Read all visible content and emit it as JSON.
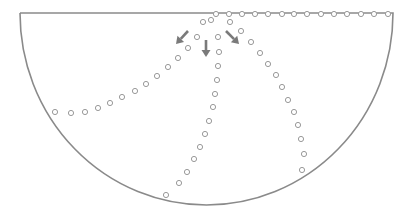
{
  "diagram": {
    "title": "",
    "shape": "half-bowl (semi-ellipse) with flat top edge",
    "bowl": {
      "left_x": 20,
      "right_x": 393,
      "top_y": 13,
      "bottom_y": 205,
      "stroke": "#8a8a8a"
    },
    "dot_style": {
      "radius": 2.6,
      "stroke": "#9a9a9a",
      "fill": "#ffffff"
    },
    "arrow_color": "#7a7a7a",
    "arrows": [
      {
        "name": "arrow-down-left",
        "x1": 188,
        "y1": 31,
        "x2": 176,
        "y2": 44
      },
      {
        "name": "arrow-down",
        "x1": 206,
        "y1": 40,
        "x2": 206,
        "y2": 57
      },
      {
        "name": "arrow-down-right",
        "x1": 226,
        "y1": 31,
        "x2": 239,
        "y2": 44
      }
    ],
    "paths": [
      {
        "name": "top-edge-dots",
        "points": [
          [
            216,
            14
          ],
          [
            229,
            14
          ],
          [
            242,
            14
          ],
          [
            255,
            14
          ],
          [
            268,
            14
          ],
          [
            282,
            14
          ],
          [
            294,
            14
          ],
          [
            307,
            14
          ],
          [
            321,
            14
          ],
          [
            334,
            14
          ],
          [
            347,
            14
          ],
          [
            361,
            14
          ],
          [
            374,
            14
          ],
          [
            388,
            14
          ]
        ]
      },
      {
        "name": "junction-dots",
        "points": [
          [
            203,
            22
          ],
          [
            211,
            20
          ],
          [
            230,
            22
          ]
        ]
      },
      {
        "name": "left-path-dots",
        "points": [
          [
            197,
            37
          ],
          [
            188,
            48
          ],
          [
            178,
            58
          ],
          [
            168,
            67
          ],
          [
            157,
            76
          ],
          [
            146,
            84
          ],
          [
            135,
            91
          ],
          [
            122,
            97
          ],
          [
            110,
            103
          ],
          [
            98,
            108
          ],
          [
            85,
            112
          ],
          [
            71,
            113
          ],
          [
            55,
            112
          ]
        ]
      },
      {
        "name": "middle-path-dots",
        "points": [
          [
            218,
            37
          ],
          [
            219,
            52
          ],
          [
            218,
            66
          ],
          [
            217,
            80
          ],
          [
            215,
            94
          ],
          [
            213,
            107
          ],
          [
            209,
            121
          ],
          [
            205,
            134
          ],
          [
            200,
            147
          ],
          [
            194,
            159
          ],
          [
            187,
            172
          ],
          [
            179,
            183
          ],
          [
            166,
            195
          ]
        ]
      },
      {
        "name": "right-path-dots",
        "points": [
          [
            241,
            31
          ],
          [
            251,
            42
          ],
          [
            260,
            53
          ],
          [
            268,
            64
          ],
          [
            276,
            75
          ],
          [
            282,
            87
          ],
          [
            288,
            100
          ],
          [
            294,
            112
          ],
          [
            298,
            125
          ],
          [
            301,
            139
          ],
          [
            304,
            154
          ],
          [
            302,
            170
          ]
        ]
      }
    ]
  }
}
